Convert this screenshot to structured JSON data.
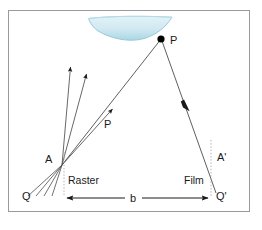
{
  "figure": {
    "background_color": "#ffffff",
    "frame": {
      "name": "figure-border",
      "color": "#9a9a9a",
      "x": 8,
      "y": 10,
      "width": 242,
      "height": 202
    },
    "colors": {
      "line": "#4d4d4d",
      "label": "#1a1a1a",
      "terrain_fill_top": "#d8eef3",
      "terrain_fill_bottom": "#a9d8e4",
      "terrain_edge": "#8fc6d6",
      "dotted_plane": "#9a9a9a",
      "point": "#000000"
    },
    "labels": {
      "point_p_outer": "P",
      "point_p_inner": "P",
      "point_a": "A",
      "point_a_prime": "A'",
      "point_q": "Q",
      "point_q_prime": "Q'",
      "plane_raster": "Raster",
      "plane_film": "Film",
      "baseline": "b"
    },
    "geometry": {
      "point_p": {
        "x": 161,
        "y": 39
      },
      "point_a": {
        "x": 62,
        "y": 165
      },
      "point_q": {
        "x": 36,
        "y": 190
      },
      "point_q_prime": {
        "x": 211,
        "y": 190
      },
      "raster_plane_x": 64,
      "film_plane_x": 211,
      "baseline_y": 198,
      "terrain": {
        "left_x": 88,
        "right_x": 172,
        "top_y": 17,
        "bottom_y": 40
      }
    },
    "rays": {
      "fan_count": 5,
      "arrow_count": 3,
      "right_ray_arrow": {
        "x": 187,
        "y": 105
      }
    }
  }
}
